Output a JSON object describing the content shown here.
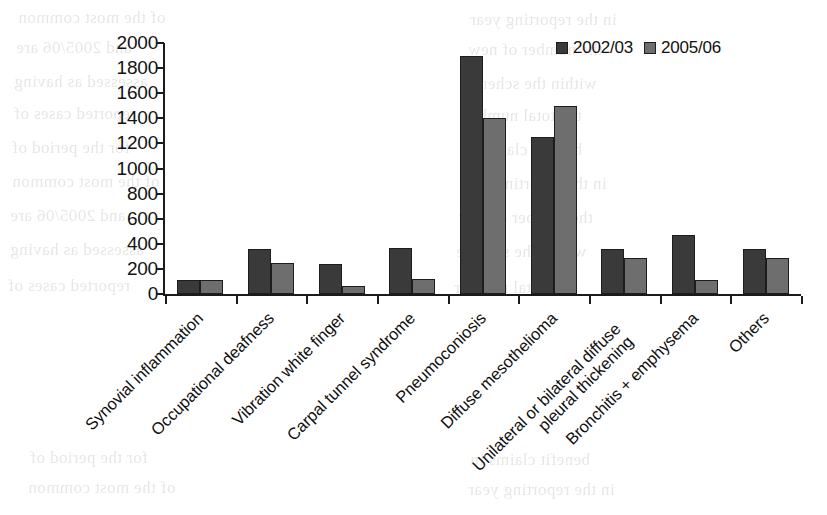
{
  "chart_data": {
    "type": "bar",
    "title": "",
    "subtitle": "",
    "xlabel": "",
    "ylabel": "",
    "ylim": [
      0,
      2000
    ],
    "ytick_step": 200,
    "grid": false,
    "legend_position": "top-right",
    "categories": [
      "Synovial inflammation",
      "Occupational deafness",
      "Vibration white finger",
      "Carpal tunnel syndrome",
      "Pneumoconiosis",
      "Diffuse mesothelioma",
      "Unilateral or bilateral diffuse pleural thickening",
      "Bronchitis + emphysema",
      "Others"
    ],
    "yticks": [
      "0",
      "200",
      "400",
      "600",
      "800",
      "1000",
      "1200",
      "1400",
      "1600",
      "1800",
      "2000"
    ],
    "series": [
      {
        "name": "2002/03",
        "color": "#3a3a3a",
        "values": [
          110,
          360,
          240,
          370,
          1900,
          1250,
          360,
          470,
          360
        ]
      },
      {
        "name": "2005/06",
        "color": "#6e6e6e",
        "values": [
          110,
          250,
          60,
          120,
          1400,
          1500,
          290,
          110,
          290
        ]
      }
    ]
  },
  "legend": {
    "items": [
      {
        "label": "2002/03",
        "color": "#3a3a3a"
      },
      {
        "label": "2005/06",
        "color": "#6e6e6e"
      }
    ]
  },
  "background_text": {
    "lines": [
      "of the most common",
      "in the reporting year",
      "and 2005/06 are",
      "the number of new",
      "assessed as having",
      "within the scheme",
      "reported cases of",
      "the total number",
      "for the period of",
      "benefit claims in"
    ]
  }
}
